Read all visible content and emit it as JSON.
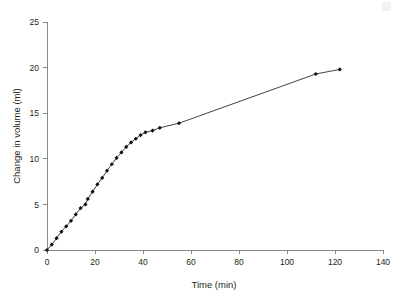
{
  "chart_data": {
    "type": "line",
    "title": "",
    "subtitle": "",
    "xlabel": "Time (min)",
    "ylabel": "Change in volume (ml)",
    "xlim": [
      0,
      140
    ],
    "ylim": [
      0,
      25
    ],
    "xticks": [
      0,
      20,
      40,
      60,
      80,
      100,
      120,
      140
    ],
    "yticks": [
      0,
      5,
      10,
      15,
      20,
      25
    ],
    "xtick_labels": [
      "0",
      "20",
      "40",
      "60",
      "80",
      "100",
      "120",
      "140"
    ],
    "ytick_labels": [
      "0",
      "5",
      "10",
      "15",
      "20",
      "25"
    ],
    "grid": false,
    "legend": null,
    "marker": "filled-diamond",
    "marker_color": "#111111",
    "line_color": "#111111",
    "axis_color": "#8a8a8a",
    "background_color": "#ffffff",
    "series": [
      {
        "name": "Change in volume",
        "x": [
          0,
          2,
          4,
          6,
          8,
          10,
          12,
          14,
          16,
          17,
          19,
          21,
          23,
          25,
          27,
          29,
          31,
          33,
          35,
          37,
          39,
          41,
          44,
          47,
          55,
          112,
          122
        ],
        "y": [
          0,
          0.6,
          1.3,
          2.0,
          2.6,
          3.2,
          3.9,
          4.6,
          5.0,
          5.6,
          6.4,
          7.2,
          7.9,
          8.7,
          9.4,
          10.1,
          10.7,
          11.3,
          11.8,
          12.2,
          12.6,
          12.9,
          13.1,
          13.4,
          13.9,
          19.3,
          19.8
        ]
      }
    ]
  },
  "labels": {
    "xlabel": "Time (min)",
    "ylabel": "Change in volume (ml)"
  }
}
